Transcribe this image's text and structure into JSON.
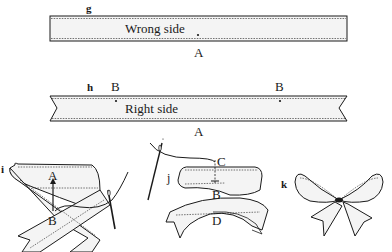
{
  "figure": {
    "panels": [
      {
        "id": "g",
        "step_label": "g",
        "ribbon_text": "Wrong side",
        "points": [
          {
            "label": "A"
          }
        ]
      },
      {
        "id": "h",
        "step_label": "h",
        "ribbon_text": "Right side",
        "points": [
          {
            "label": "B"
          },
          {
            "label": "B"
          },
          {
            "label": "A"
          }
        ]
      },
      {
        "id": "i",
        "step_label": "i",
        "points": [
          {
            "label": "A"
          },
          {
            "label": "B"
          }
        ]
      },
      {
        "id": "j",
        "step_label": "j",
        "points": [
          {
            "label": "C"
          },
          {
            "label": "B"
          },
          {
            "label": "D"
          }
        ]
      },
      {
        "id": "k",
        "step_label": "k"
      }
    ],
    "colors": {
      "ink": "#1a1a1a",
      "ribbon_fill": "#f4f4f4",
      "paper": "#ffffff"
    }
  }
}
